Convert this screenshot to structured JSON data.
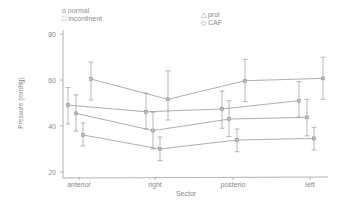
{
  "chart_data": {
    "type": "line",
    "title": "",
    "xlabel": "Sector",
    "ylabel": "Pressure (mmHg)",
    "categories": [
      "anterior",
      "right",
      "posterio",
      "left"
    ],
    "yticks": [
      20,
      40,
      60,
      80
    ],
    "ylim": [
      17,
      83
    ],
    "grid": false,
    "legend_position": "top",
    "legend": [
      {
        "marker": "o",
        "label": "normal"
      },
      {
        "marker": "□",
        "label": "incontinent"
      },
      {
        "marker": "△",
        "label": "prol"
      },
      {
        "marker": "◇",
        "label": "CAF"
      }
    ],
    "series": [
      {
        "name": "normal",
        "values": [
          60.4,
          51.6,
          59.7,
          60.7
        ],
        "err_high": [
          67.8,
          64.0,
          69.0,
          69.9
        ],
        "err_low": [
          51.3,
          42.6,
          50.6,
          51.6
        ],
        "x_offsets": [
          12,
          13,
          12,
          13
        ]
      },
      {
        "name": "incontinent",
        "values": [
          49.1,
          46.2,
          47.4,
          51.0
        ],
        "err_high": [
          56.7,
          54.3,
          55.2,
          59.3
        ],
        "err_low": [
          40.9,
          38.7,
          39.0,
          43.8
        ],
        "x_offsets": [
          -11,
          -9,
          -11,
          -11
        ]
      },
      {
        "name": "prol",
        "values": [
          45.5,
          38.0,
          43.0,
          43.8
        ],
        "err_high": [
          53.5,
          46.0,
          51.0,
          51.6
        ],
        "err_low": [
          37.8,
          30.0,
          35.4,
          35.7
        ],
        "x_offsets": [
          -3,
          -2,
          -4,
          -3
        ]
      },
      {
        "name": "CAF",
        "values": [
          36.1,
          30.0,
          33.9,
          34.6
        ],
        "err_high": [
          41.3,
          35.2,
          38.7,
          39.3
        ],
        "err_low": [
          31.3,
          24.9,
          28.8,
          29.6
        ],
        "x_offsets": [
          4,
          5,
          4,
          4
        ]
      }
    ]
  },
  "legend_left": [
    {
      "symbol": "o",
      "label": "normal"
    },
    {
      "symbol": "□",
      "label": "incontinent"
    }
  ],
  "legend_right": [
    {
      "symbol": "△",
      "label": "prol"
    },
    {
      "symbol": "◇",
      "label": "CAF"
    }
  ],
  "colors": {
    "line": "#9a9a9a",
    "text": "#8a8a8a",
    "axis": "#a0a0a0"
  }
}
